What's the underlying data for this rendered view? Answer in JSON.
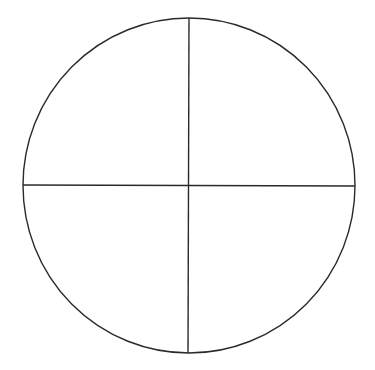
{
  "diagram": {
    "type": "circle-quadrants",
    "colors": {
      "background": "#ffffff",
      "stroke": "#2a2a2a"
    },
    "circle": {
      "cx": 189,
      "cy": 185.5,
      "rx": 166,
      "ry": 167.5
    },
    "horizontal_line": {
      "x1": 23,
      "y1": 185,
      "x2": 355,
      "y2": 186
    },
    "vertical_line": {
      "x1": 189,
      "y1": 18,
      "x2": 188,
      "y2": 353
    },
    "quadrants": 4
  }
}
